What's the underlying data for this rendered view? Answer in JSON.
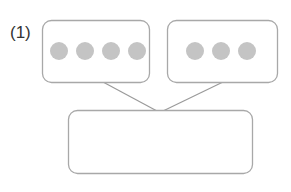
{
  "problem": {
    "label": "(1)"
  },
  "diagram": {
    "left_box": {
      "dot_count": 4
    },
    "right_box": {
      "dot_count": 3
    },
    "bottom_box": {
      "content": ""
    },
    "colors": {
      "border": "#a8a8a8",
      "dot": "#c4c4c4",
      "line": "#9a9a9a"
    }
  }
}
